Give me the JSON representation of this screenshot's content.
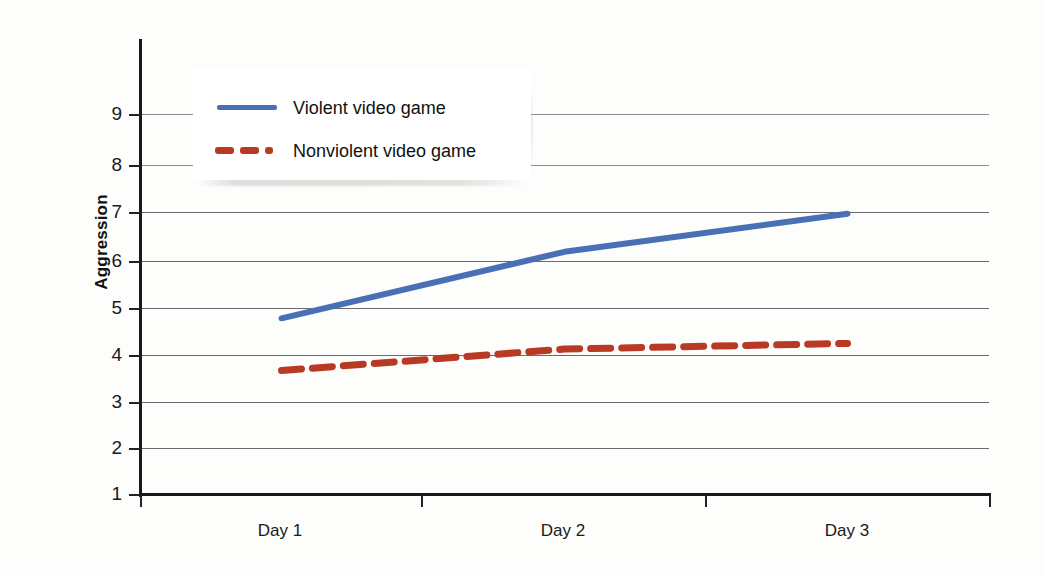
{
  "chart_data": {
    "type": "line",
    "title": "",
    "xlabel": "",
    "ylabel": "Aggression",
    "categories": [
      "Day 1",
      "Day 2",
      "Day 3"
    ],
    "ylim": [
      1,
      9
    ],
    "yticks": [
      9,
      8,
      7,
      6,
      5,
      4,
      3,
      2,
      1
    ],
    "ytick_labels": [
      "9",
      "8",
      "7",
      "6",
      "5",
      "4",
      "3",
      "2",
      "1"
    ],
    "grid": true,
    "legend_position": "upper left",
    "series": [
      {
        "name": "Violent video game",
        "values": [
          4.7,
          6.1,
          6.9
        ],
        "color": "#4a6fb5",
        "style": "solid"
      },
      {
        "name": "Nonviolent video game",
        "values": [
          3.6,
          4.05,
          4.17
        ],
        "color": "#b83a25",
        "style": "dashed"
      }
    ]
  },
  "axis": {
    "y_title": "Aggression"
  },
  "legend": {
    "entries": [
      {
        "label": "Violent video game"
      },
      {
        "label": "Nonviolent video game"
      }
    ]
  },
  "x_labels": [
    "Day 1",
    "Day 2",
    "Day 3"
  ],
  "y_labels": [
    "9",
    "8",
    "7",
    "6",
    "5",
    "4",
    "3",
    "2",
    "1"
  ]
}
